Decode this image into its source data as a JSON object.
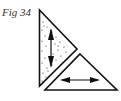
{
  "figure": {
    "caption": "Fig 34",
    "shapes": [
      {
        "name": "dotted-right-triangle",
        "fill": "stippled",
        "arrow": "vertical double-headed"
      },
      {
        "name": "plain-triangle",
        "fill": "none",
        "arrow": "horizontal double-headed"
      }
    ],
    "colors": {
      "stroke": "#111111",
      "background": "#ffffff"
    }
  }
}
